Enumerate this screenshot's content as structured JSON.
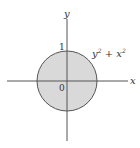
{
  "diagram": {
    "axes": {
      "x_label": "x",
      "y_label": "y"
    },
    "labels": {
      "one": "1",
      "origin": "0",
      "curve_base1": "y",
      "curve_exp1": "2",
      "curve_op": " + ",
      "curve_base2": "x",
      "curve_exp2": "2"
    },
    "circle": {
      "center": [
        67,
        81
      ],
      "radius": 30,
      "fill": "#d9d9d9",
      "stroke": "#555555"
    }
  }
}
